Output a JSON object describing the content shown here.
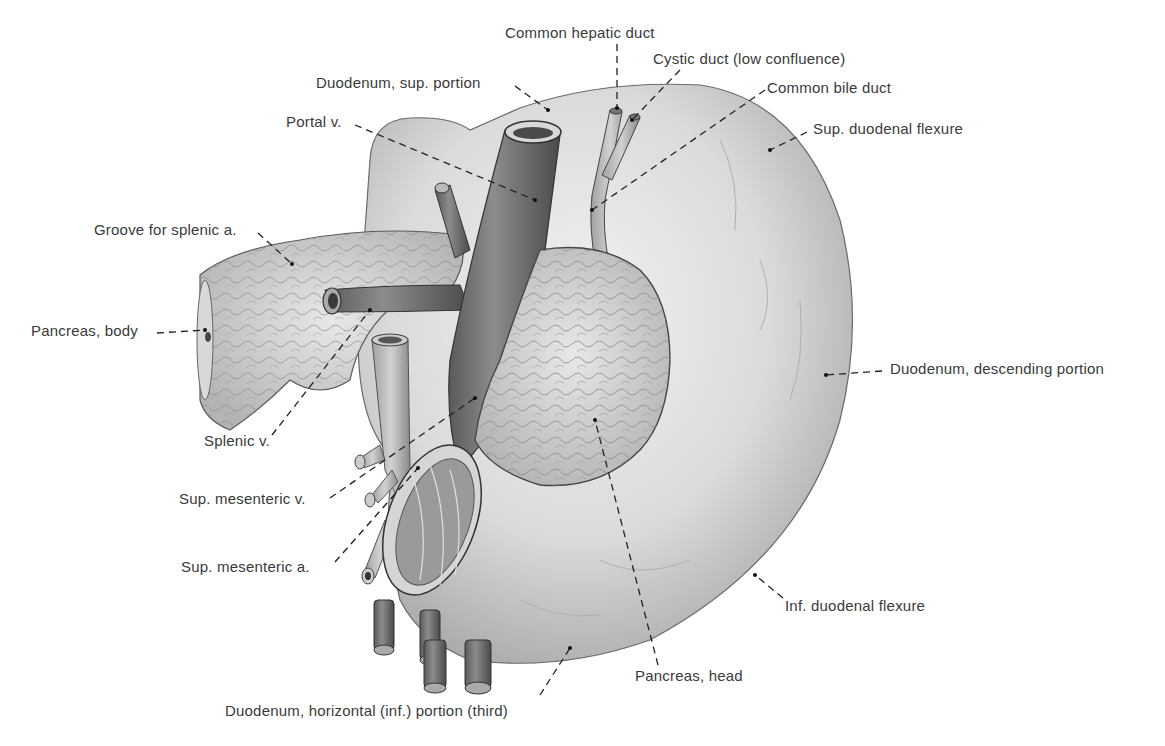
{
  "figure": {
    "type": "anatomical-illustration",
    "colors": {
      "background": "#ffffff",
      "label_text": "#3a3a3a",
      "leader_line": "#222222",
      "organ_light": "#e6e6e6",
      "organ_mid": "#bdbdbd",
      "vessel_dark": "#6e6e6e"
    }
  },
  "labels": [
    {
      "id": "common-hepatic-duct",
      "text": "Common hepatic duct",
      "x": 505,
      "y": 24
    },
    {
      "id": "cystic-duct",
      "text": "Cystic duct (low confluence)",
      "x": 653,
      "y": 50
    },
    {
      "id": "common-bile-duct",
      "text": "Common bile duct",
      "x": 767,
      "y": 79
    },
    {
      "id": "duodenum-sup-portion",
      "text": "Duodenum, sup. portion",
      "x": 316,
      "y": 74
    },
    {
      "id": "portal-v",
      "text": "Portal v.",
      "x": 286,
      "y": 113
    },
    {
      "id": "sup-duodenal-flexure",
      "text": "Sup. duodenal flexure",
      "x": 813,
      "y": 120
    },
    {
      "id": "groove-splenic-a",
      "text": "Groove for splenic a.",
      "x": 94,
      "y": 221
    },
    {
      "id": "pancreas-body",
      "text": "Pancreas, body",
      "x": 31,
      "y": 322
    },
    {
      "id": "duodenum-descending",
      "text": "Duodenum, descending portion",
      "x": 890,
      "y": 360
    },
    {
      "id": "splenic-v",
      "text": "Splenic v.",
      "x": 204,
      "y": 432
    },
    {
      "id": "sup-mesenteric-v",
      "text": "Sup. mesenteric v.",
      "x": 179,
      "y": 490
    },
    {
      "id": "sup-mesenteric-a",
      "text": "Sup. mesenteric a.",
      "x": 181,
      "y": 558
    },
    {
      "id": "inf-duodenal-flexure",
      "text": "Inf. duodenal flexure",
      "x": 785,
      "y": 597
    },
    {
      "id": "pancreas-head",
      "text": "Pancreas, head",
      "x": 635,
      "y": 667
    },
    {
      "id": "duodenum-horizontal",
      "text": "Duodenum, horizontal (inf.) portion (third)",
      "x": 225,
      "y": 702
    }
  ]
}
